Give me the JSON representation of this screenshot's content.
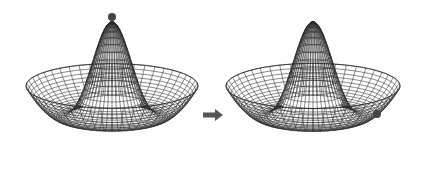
{
  "diagram": {
    "colors": {
      "background": "#ffffff",
      "wire": "#2a2a2a",
      "ball": "#444444",
      "arrow": "#555555"
    },
    "panels": [
      {
        "id": "before",
        "cx": 112,
        "peak_y": 22,
        "rim_rx": 86,
        "rim_top_y": 58,
        "base_y": 163,
        "ball": {
          "x": 112,
          "y": 17,
          "r": 4,
          "position": "top-of-hill"
        }
      },
      {
        "id": "after",
        "cx": 313,
        "peak_y": 22,
        "rim_rx": 87,
        "rim_top_y": 58,
        "base_y": 163,
        "ball": {
          "x": 377,
          "y": 114,
          "r": 4,
          "position": "in-trough"
        }
      }
    ],
    "arrow": {
      "x1": 203,
      "x2": 223,
      "y": 115,
      "direction": "right"
    }
  }
}
